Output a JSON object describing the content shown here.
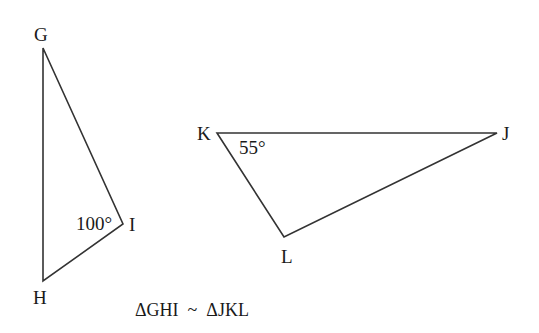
{
  "diagram": {
    "triangle_ghi": {
      "vertices": {
        "G": "G",
        "H": "H",
        "I": "I"
      },
      "angle_at_I": "100°"
    },
    "triangle_jkl": {
      "vertices": {
        "J": "J",
        "K": "K",
        "L": "L"
      },
      "angle_at_K": "55°"
    },
    "similarity_statement": "ΔGHI  ~  ΔJKL"
  },
  "colors": {
    "line": "#333333",
    "text": "#1a1a1a",
    "background": "#ffffff"
  }
}
